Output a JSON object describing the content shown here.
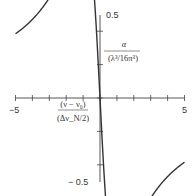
{
  "chart_data": {
    "type": "line",
    "title": "",
    "xlabel_num": "(ν − ν₀)",
    "xlabel_den": "(Δν_N/2)",
    "ylabel_num": "α",
    "ylabel_den": "(λ³/16π³)",
    "xlim": [
      -5,
      5
    ],
    "ylim": [
      -0.5,
      0.5
    ],
    "x_tick_labels": [
      "−5",
      "5"
    ],
    "y_tick_labels": [
      "0.5",
      "− 0.5"
    ],
    "x_ticks": [
      -5,
      -4,
      -3,
      -2,
      -1,
      0,
      1,
      2,
      3,
      4,
      5
    ],
    "y_ticks": [
      -0.5,
      -0.4,
      -0.3,
      -0.2,
      -0.1,
      0,
      0.1,
      0.2,
      0.3,
      0.4,
      0.5
    ],
    "grid": false,
    "legend": null,
    "series": [
      {
        "name": "dispersion curve",
        "formula": "alpha = -x/(1+x^2)",
        "x": [
          -5,
          -4,
          -3,
          -2,
          -1.5,
          -1,
          -0.5,
          0,
          0.5,
          1,
          1.5,
          2,
          3,
          4,
          5
        ],
        "y": [
          0.192,
          0.235,
          0.3,
          0.4,
          0.462,
          0.5,
          0.4,
          0,
          -0.4,
          -0.5,
          -0.462,
          -0.4,
          -0.3,
          -0.235,
          -0.192
        ]
      }
    ],
    "color": "#333333"
  }
}
